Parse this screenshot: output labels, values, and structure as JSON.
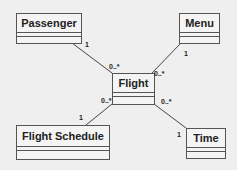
{
  "diagram": {
    "type": "UML class diagram",
    "classes": [
      {
        "id": "passenger",
        "name": "Passenger"
      },
      {
        "id": "menu",
        "name": "Menu"
      },
      {
        "id": "flight",
        "name": "Flight"
      },
      {
        "id": "flight_schedule",
        "name": "Flight Schedule"
      },
      {
        "id": "time",
        "name": "Time"
      }
    ],
    "associations": [
      {
        "from": "Passenger",
        "from_mult": "1",
        "to": "Flight",
        "to_mult": "0..*"
      },
      {
        "from": "Menu",
        "from_mult": "1",
        "to": "Flight",
        "to_mult": "0..*"
      },
      {
        "from": "Flight Schedule",
        "from_mult": "1",
        "to": "Flight",
        "to_mult": "0..*"
      },
      {
        "from": "Time",
        "from_mult": "1",
        "to": "Flight",
        "to_mult": "0..*"
      }
    ]
  },
  "labels": {
    "passenger": "Passenger",
    "menu": "Menu",
    "flight": "Flight",
    "flight_schedule": "Flight Schedule",
    "time": "Time",
    "m_passenger_1": "1",
    "m_passenger_flight": "0..*",
    "m_menu_1": "1",
    "m_menu_flight": "0..*",
    "m_schedule_1": "1",
    "m_schedule_flight": "0..*",
    "m_time_1": "1",
    "m_time_flight": "0..*"
  }
}
